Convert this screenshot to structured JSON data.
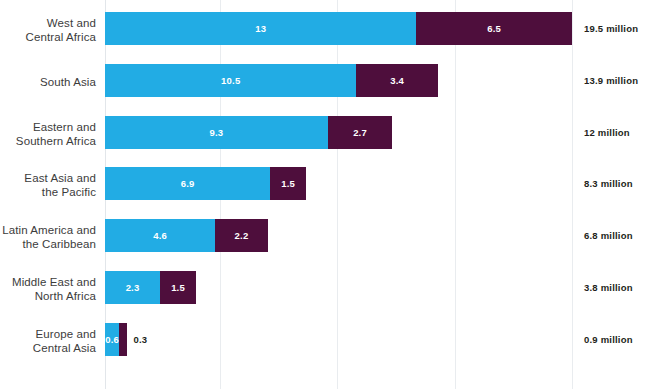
{
  "chart_data": {
    "type": "bar",
    "subtype": "stacked-horizontal",
    "title": "",
    "subtitle": "",
    "xlabel": "",
    "ylabel": "",
    "xlim": [
      0,
      19.5
    ],
    "grid": true,
    "gridlines_at": [
      4.8,
      9.7,
      14.6,
      19.5
    ],
    "legend_position": "none",
    "categories": [
      "West and Central Africa",
      "South Asia",
      "Eastern and Southern Africa",
      "East Asia and the Pacific",
      "Latin America and the Caribbean",
      "Middle East and North Africa",
      "Europe and Central Asia"
    ],
    "series": [
      {
        "name": "blue",
        "color": "#22ace4",
        "values": [
          13,
          10.5,
          9.3,
          6.9,
          4.6,
          2.3,
          0.6
        ]
      },
      {
        "name": "purple",
        "color": "#4e0e3c",
        "values": [
          6.5,
          3.4,
          2.7,
          1.5,
          2.2,
          1.5,
          0.3
        ]
      }
    ],
    "totals": [
      19.5,
      13.9,
      12,
      8.3,
      6.8,
      3.8,
      0.9
    ],
    "total_unit": "million"
  },
  "rows": [
    {
      "label_lines": [
        "West and",
        "Central Africa"
      ],
      "blue_value": "13",
      "purple_value": "6.5",
      "total_text": "19.5 million",
      "blue_outside": false,
      "purple_outside": false
    },
    {
      "label_lines": [
        "South Asia"
      ],
      "blue_value": "10.5",
      "purple_value": "3.4",
      "total_text": "13.9 million",
      "blue_outside": false,
      "purple_outside": false
    },
    {
      "label_lines": [
        "Eastern and",
        "Southern Africa"
      ],
      "blue_value": "9.3",
      "purple_value": "2.7",
      "total_text": "12 million",
      "blue_outside": false,
      "purple_outside": false
    },
    {
      "label_lines": [
        "East Asia and",
        "the Pacific"
      ],
      "blue_value": "6.9",
      "purple_value": "1.5",
      "total_text": "8.3 million",
      "blue_outside": false,
      "purple_outside": false
    },
    {
      "label_lines": [
        "Latin America and",
        "the Caribbean"
      ],
      "blue_value": "4.6",
      "purple_value": "2.2",
      "total_text": "6.8 million",
      "blue_outside": false,
      "purple_outside": false
    },
    {
      "label_lines": [
        "Middle East and",
        "North Africa"
      ],
      "blue_value": "2.3",
      "purple_value": "1.5",
      "total_text": "3.8 million",
      "blue_outside": false,
      "purple_outside": false
    },
    {
      "label_lines": [
        "Europe and",
        "Central Asia"
      ],
      "blue_value": "0.6",
      "purple_value": "0.3",
      "total_text": "0.9 million",
      "blue_outside": false,
      "purple_outside": true
    }
  ],
  "colors": {
    "blue": "#22ace4",
    "purple": "#4e0e3c",
    "gridline": "#e9ecef",
    "label_text": "#3c3c3c",
    "value_text": "#ffffff",
    "total_text": "#231f20",
    "background": "#ffffff"
  }
}
